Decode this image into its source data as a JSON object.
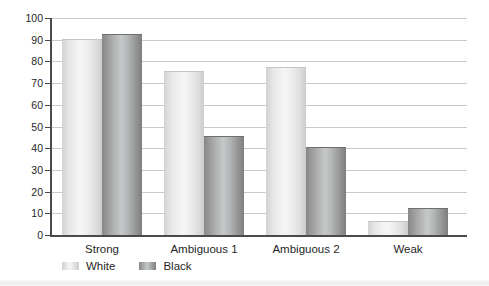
{
  "chart_data": {
    "type": "bar",
    "categories": [
      "Strong",
      "Ambiguous 1",
      "Ambiguous 2",
      "Weak"
    ],
    "series": [
      {
        "name": "White",
        "values": [
          90,
          75,
          77,
          6
        ]
      },
      {
        "name": "Black",
        "values": [
          92,
          45,
          40,
          12
        ]
      }
    ],
    "title": "",
    "xlabel": "",
    "ylabel": "",
    "ylim": [
      0,
      100
    ],
    "y_ticks": [
      0,
      10,
      20,
      30,
      40,
      50,
      60,
      70,
      80,
      90,
      100
    ],
    "grid": "horizontal",
    "legend_position": "bottom-left",
    "colors": {
      "white_bar_edge": "#d2d2d2",
      "white_bar_center": "#f6f6f6",
      "black_bar_edge": "#7e7e7e",
      "black_bar_center": "#c6c9c9",
      "gridline": "#c9c9c9",
      "axis": "#4a4a4a",
      "text": "#1f1f1f",
      "background": "#ffffff"
    }
  }
}
